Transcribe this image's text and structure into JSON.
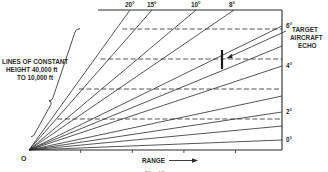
{
  "diagram": {
    "origin_label": "O",
    "x_axis_label": "RANGE",
    "x_axis_arrow": "right-arrow",
    "caption": "Fig. 10",
    "constant_height_label": [
      "LINES OF CONSTANT",
      "HEIGHT 40,000 ft",
      "TO 10,000 ft"
    ],
    "constant_height_lines_ft": [
      40000,
      30000,
      20000,
      10000
    ],
    "elevation_lines": [
      {
        "angle_deg": 0,
        "label": "0°",
        "edge": "right"
      },
      {
        "angle_deg": 1,
        "label": "",
        "edge": "right"
      },
      {
        "angle_deg": 2,
        "label": "2°",
        "edge": "right"
      },
      {
        "angle_deg": 3,
        "label": "",
        "edge": "right"
      },
      {
        "angle_deg": 4,
        "label": "4°",
        "edge": "right"
      },
      {
        "angle_deg": 5,
        "label": "",
        "edge": "right"
      },
      {
        "angle_deg": 6,
        "label": "6°",
        "edge": "right"
      },
      {
        "angle_deg": 8,
        "label": "8°",
        "edge": "top"
      },
      {
        "angle_deg": 10,
        "label": "10°",
        "edge": "top"
      },
      {
        "angle_deg": 15,
        "label": "15°",
        "edge": "top"
      },
      {
        "angle_deg": 20,
        "label": "20°",
        "edge": "top"
      }
    ],
    "range_tick_count": 4,
    "target": {
      "label": [
        "TARGET",
        "AIRCRAFT",
        "ECHO"
      ],
      "height_ft": 30000
    },
    "colors": {
      "ink": "#2a2a2a",
      "background": "#ffffff"
    }
  }
}
